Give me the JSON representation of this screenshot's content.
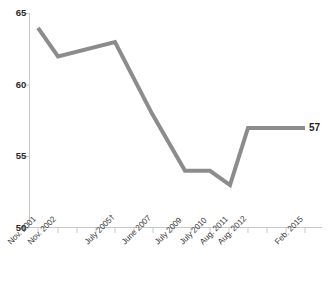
{
  "chart_data": {
    "type": "line",
    "title": "",
    "subtitle": "",
    "xlabel": "",
    "ylabel": "",
    "categories": [
      "Nov. 2001",
      "Nov. 2002",
      "July 2005†",
      "June 2007",
      "July 2009",
      "July 2010",
      "Aug. 2011",
      "Aug. 2012",
      "Feb. 2015"
    ],
    "values": [
      64,
      62,
      63,
      58,
      54,
      54,
      53,
      57,
      57
    ],
    "series": [
      {
        "name": "",
        "values": [
          64,
          62,
          63,
          58,
          54,
          54,
          53,
          57,
          57
        ]
      }
    ],
    "ylim": [
      50,
      65
    ],
    "yticks": [
      50,
      55,
      60,
      65
    ],
    "ytick_labels": [
      "50",
      "55",
      "60",
      "65"
    ],
    "grid": false,
    "legend": false,
    "legend_position": "none",
    "annotations": [
      {
        "text": "57",
        "category": "Feb. 2015",
        "value": 57,
        "position": "end-of-line"
      }
    ],
    "line_color": "#8c8c8c",
    "line_width": 4,
    "axis_color": "#c8c8c8",
    "tick_label_color": "#2b2b2b",
    "background_color": "#ffffff"
  },
  "axes": {
    "y_labels": [
      "65",
      "60",
      "55",
      "50"
    ],
    "x_labels": [
      "Nov. 2001",
      "Nov. 2002",
      "July 2005†",
      "June 2007",
      "July 2009",
      "July 2010",
      "Aug. 2011",
      "Aug. 2012",
      "Feb. 2015"
    ]
  },
  "labels": {
    "end_value": "57"
  }
}
